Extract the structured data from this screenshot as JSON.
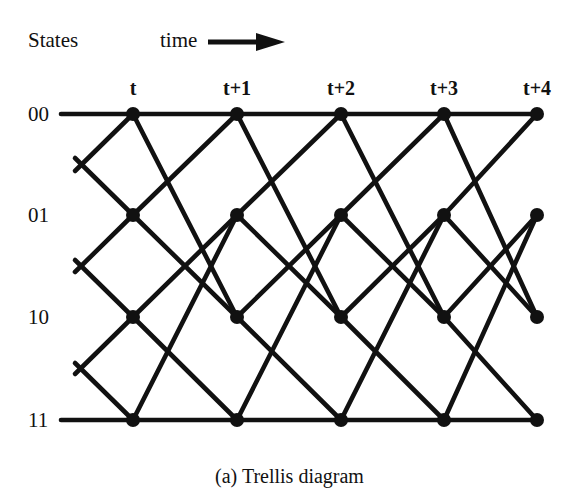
{
  "figure": {
    "caption": "(a) Trellis diagram",
    "states_heading": "States",
    "time_heading": "time",
    "time_arrow_icon": "right-arrow-icon",
    "line_color": "#111111",
    "node_color": "#111111",
    "background_color": "#ffffff"
  },
  "axes": {
    "state_labels": [
      "00",
      "01",
      "10",
      "11"
    ],
    "time_labels": [
      "t",
      "t+1",
      "t+2",
      "t+3",
      "t+4"
    ]
  },
  "chart_data": {
    "type": "diagram",
    "title": "(a) Trellis diagram",
    "xlabel": "time",
    "ylabel": "States",
    "states": [
      "00",
      "01",
      "10",
      "11"
    ],
    "time_steps": [
      "t",
      "t+1",
      "t+2",
      "t+3",
      "t+4"
    ],
    "node_x": [
      133,
      237,
      341,
      444,
      537
    ],
    "row_y": [
      114,
      215,
      317,
      420
    ],
    "nodes": [
      {
        "state": "00",
        "time": "t",
        "x": 133,
        "y": 114
      },
      {
        "state": "01",
        "time": "t",
        "x": 133,
        "y": 215
      },
      {
        "state": "10",
        "time": "t",
        "x": 133,
        "y": 317
      },
      {
        "state": "11",
        "time": "t",
        "x": 133,
        "y": 420
      },
      {
        "state": "00",
        "time": "t+1",
        "x": 237,
        "y": 114
      },
      {
        "state": "01",
        "time": "t+1",
        "x": 237,
        "y": 215
      },
      {
        "state": "10",
        "time": "t+1",
        "x": 237,
        "y": 317
      },
      {
        "state": "11",
        "time": "t+1",
        "x": 237,
        "y": 420
      },
      {
        "state": "00",
        "time": "t+2",
        "x": 341,
        "y": 114
      },
      {
        "state": "01",
        "time": "t+2",
        "x": 341,
        "y": 215
      },
      {
        "state": "10",
        "time": "t+2",
        "x": 341,
        "y": 317
      },
      {
        "state": "11",
        "time": "t+2",
        "x": 341,
        "y": 420
      },
      {
        "state": "00",
        "time": "t+3",
        "x": 444,
        "y": 114
      },
      {
        "state": "01",
        "time": "t+3",
        "x": 444,
        "y": 215
      },
      {
        "state": "10",
        "time": "t+3",
        "x": 444,
        "y": 317
      },
      {
        "state": "11",
        "time": "t+3",
        "x": 444,
        "y": 420
      },
      {
        "state": "00",
        "time": "t+4",
        "x": 537,
        "y": 114
      },
      {
        "state": "01",
        "time": "t+4",
        "x": 537,
        "y": 215
      },
      {
        "state": "10",
        "time": "t+4",
        "x": 537,
        "y": 317
      },
      {
        "state": "11",
        "time": "t+4",
        "x": 537,
        "y": 420
      }
    ],
    "transitions": [
      {
        "from": "00",
        "to": "00"
      },
      {
        "from": "00",
        "to": "10"
      },
      {
        "from": "01",
        "to": "00"
      },
      {
        "from": "01",
        "to": "10"
      },
      {
        "from": "10",
        "to": "01"
      },
      {
        "from": "10",
        "to": "11"
      },
      {
        "from": "11",
        "to": "01"
      },
      {
        "from": "11",
        "to": "11"
      }
    ],
    "left_stubs": [
      {
        "state": "00",
        "direction": "horizontal-left"
      },
      {
        "state": "00",
        "direction": "down-left"
      },
      {
        "state": "01",
        "direction": "up-left"
      },
      {
        "state": "01",
        "direction": "down-left"
      },
      {
        "state": "10",
        "direction": "up-left"
      },
      {
        "state": "10",
        "direction": "down-left"
      },
      {
        "state": "11",
        "direction": "up-left"
      },
      {
        "state": "11",
        "direction": "horizontal-left"
      }
    ],
    "node_radius": 7,
    "edge_width": 4.6,
    "grid": false,
    "legend": false
  }
}
